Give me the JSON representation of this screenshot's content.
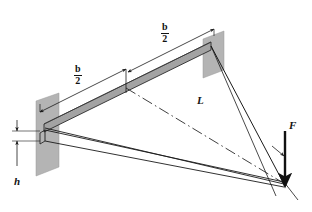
{
  "figure": {
    "background_color": "#ffffff",
    "line_color": "#1a1a1a",
    "beam_fill": "#a3a3a3",
    "beam_fill_dark": "#8c8c8c",
    "wall_fill": "#b4b4b4"
  },
  "labels": {
    "span_upper": {
      "numerator": "b",
      "denominator": "2"
    },
    "span_lower": {
      "numerator": "b",
      "denominator": "2"
    },
    "length": "L",
    "height": "h",
    "force": "F"
  },
  "icons": {
    "force_arrow": "down-arrow-icon",
    "height_arrow_up": "up-arrow-icon",
    "height_arrow_down": "down-arrow-icon",
    "dimension_arrow": "dimension-arrow-icon",
    "centerline": "dash-dot-line-icon"
  },
  "geometry": {
    "wall_left_plate": "40,103 58,96 58,166 40,173",
    "wall_right_plate": "205,38 222,33 222,70 205,75",
    "beam_top_edge": "44,125 210,43",
    "beam_bottom_edge": "44,132 210,50",
    "apex": "283,184",
    "left_node": "44,127",
    "right_node": "210,46",
    "mid_node": "126,85"
  },
  "annotations": {
    "dimension_upper_from": "126,76",
    "dimension_upper_to": "212,34",
    "dimension_lower_from": "41,112",
    "dimension_lower_to": "126,70"
  }
}
